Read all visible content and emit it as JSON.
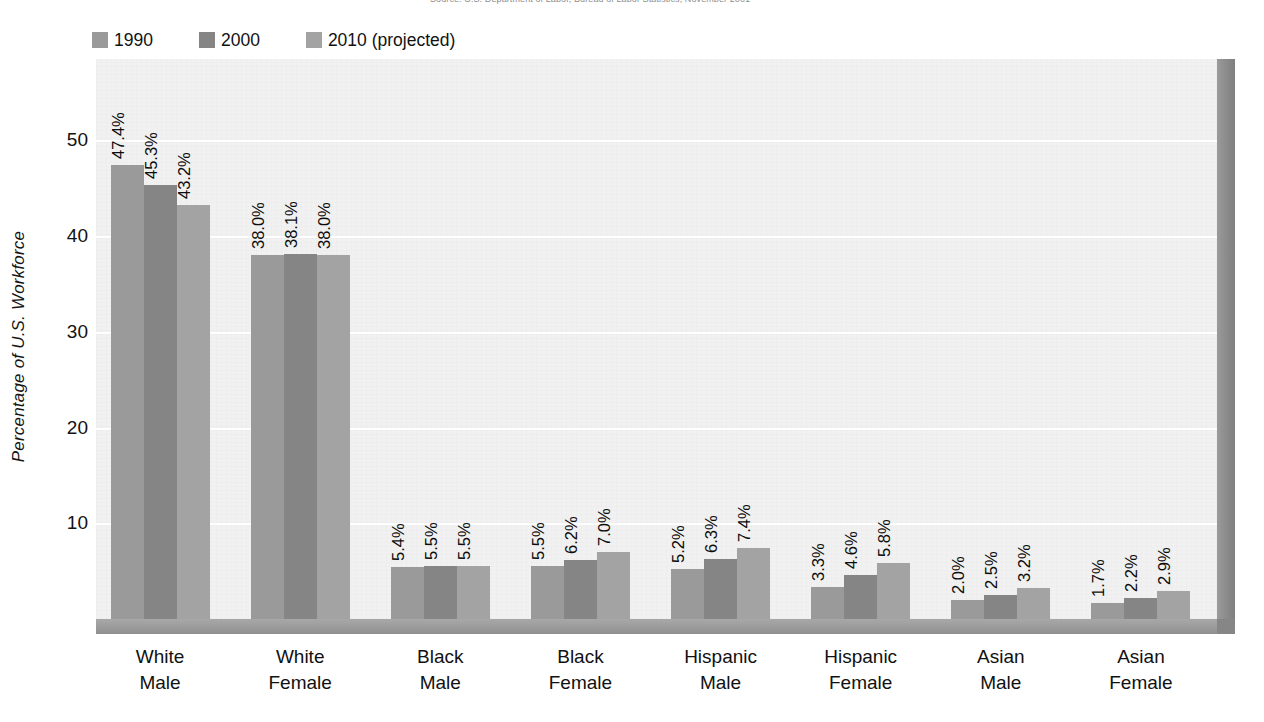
{
  "source_note": "Source: U.S. Department of Labor, Bureau of Labor Statistics, November 2001",
  "legend": {
    "items": [
      {
        "label": "1990",
        "color": "#9a9a9a",
        "icon": "legend-swatch-1990"
      },
      {
        "label": "2000",
        "color": "#858585",
        "icon": "legend-swatch-2000"
      },
      {
        "label": "2010 (projected)",
        "color": "#a3a3a3",
        "icon": "legend-swatch-2010"
      }
    ]
  },
  "axes": {
    "y_title": "Percentage of  U.S. Workforce",
    "y_ticks": [
      "50",
      "40",
      "30",
      "20",
      "10"
    ],
    "y_tick_values": [
      50,
      40,
      30,
      20,
      10
    ],
    "y_min": 0,
    "y_max": 58.5
  },
  "colors": {
    "series_1990": "#9a9a9a",
    "series_2000": "#858585",
    "series_2010": "#a3a3a3",
    "plot_background": "#f1f1f1",
    "floor": "#9a9a9a",
    "right_wall": "#8a8a8a",
    "gridline": "#ffffff",
    "text": "#121212"
  },
  "chart_data": {
    "type": "bar",
    "title": "",
    "subtitle": "",
    "xlabel": "",
    "ylabel": "Percentage of  U.S. Workforce",
    "ylim": [
      0,
      58.5
    ],
    "grid": true,
    "legend_position": "top-left",
    "categories": [
      "White Male",
      "White Female",
      "Black Male",
      "Black Female",
      "Hispanic Male",
      "Hispanic Female",
      "Asian Male",
      "Asian Female"
    ],
    "category_lines": [
      [
        "White",
        "Male"
      ],
      [
        "White",
        "Female"
      ],
      [
        "Black",
        "Male"
      ],
      [
        "Black",
        "Female"
      ],
      [
        "Hispanic",
        "Male"
      ],
      [
        "Hispanic",
        "Female"
      ],
      [
        "Asian",
        "Male"
      ],
      [
        "Asian",
        "Female"
      ]
    ],
    "series": [
      {
        "name": "1990",
        "color": "#9a9a9a",
        "values": [
          47.4,
          38.0,
          5.4,
          5.5,
          5.2,
          3.3,
          2.0,
          1.7
        ],
        "labels": [
          "47.4%",
          "38.0%",
          "5.4%",
          "5.5%",
          "5.2%",
          "3.3%",
          "2.0%",
          "1.7%"
        ]
      },
      {
        "name": "2000",
        "color": "#858585",
        "values": [
          45.3,
          38.1,
          5.5,
          6.2,
          6.3,
          4.6,
          2.5,
          2.2
        ],
        "labels": [
          "45.3%",
          "38.1%",
          "5.5%",
          "6.2%",
          "6.3%",
          "4.6%",
          "2.5%",
          "2.2%"
        ]
      },
      {
        "name": "2010 (projected)",
        "color": "#a3a3a3",
        "values": [
          43.2,
          38.0,
          5.5,
          7.0,
          7.4,
          5.8,
          3.2,
          2.9
        ],
        "labels": [
          "43.2%",
          "38.0%",
          "5.5%",
          "7.0%",
          "7.4%",
          "5.8%",
          "3.2%",
          "2.9%"
        ]
      }
    ]
  }
}
